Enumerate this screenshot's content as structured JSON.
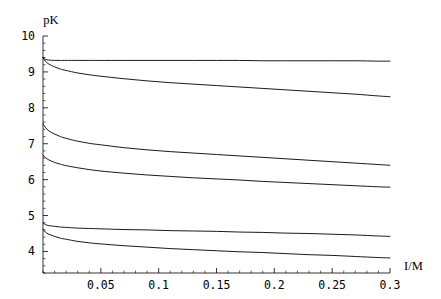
{
  "chart_data": {
    "type": "line",
    "title": "",
    "subtitle": "",
    "xlabel": "I/M",
    "ylabel": "pK",
    "xlim": [
      0.0,
      0.3
    ],
    "ylim": [
      3.4,
      10.0
    ],
    "grid": false,
    "legend": "none",
    "x_ticks": [
      0.05,
      0.1,
      0.15,
      0.2,
      0.25,
      0.3
    ],
    "x_tick_labels": [
      "0.05",
      "0.1",
      "0.15",
      "0.2",
      "0.25",
      "0.3"
    ],
    "y_ticks": [
      4,
      5,
      6,
      7,
      8,
      9,
      10
    ],
    "y_tick_labels": [
      "4",
      "5",
      "6",
      "7",
      "8",
      "9",
      "10"
    ],
    "x_minor_tick_step": 0.01,
    "y_minor_tick_step": 0.2,
    "x": [
      0.0,
      0.002,
      0.005,
      0.01,
      0.015,
      0.02,
      0.03,
      0.04,
      0.05,
      0.07,
      0.09,
      0.11,
      0.13,
      0.15,
      0.17,
      0.19,
      0.21,
      0.23,
      0.25,
      0.27,
      0.29,
      0.3
    ],
    "series": [
      {
        "name": "curve-1",
        "start_value": 9.4,
        "end_value": 9.3,
        "values": [
          9.4,
          9.35,
          9.33,
          9.32,
          9.32,
          9.32,
          9.32,
          9.32,
          9.32,
          9.32,
          9.32,
          9.32,
          9.32,
          9.32,
          9.32,
          9.31,
          9.31,
          9.31,
          9.31,
          9.31,
          9.3,
          9.3
        ]
      },
      {
        "name": "curve-2",
        "start_value": 9.4,
        "end_value": 8.3,
        "values": [
          9.4,
          9.3,
          9.22,
          9.14,
          9.08,
          9.04,
          8.97,
          8.92,
          8.88,
          8.81,
          8.75,
          8.7,
          8.66,
          8.62,
          8.58,
          8.54,
          8.5,
          8.46,
          8.42,
          8.38,
          8.33,
          8.31
        ]
      },
      {
        "name": "curve-3",
        "start_value": 7.55,
        "end_value": 6.4,
        "values": [
          7.55,
          7.46,
          7.36,
          7.27,
          7.2,
          7.15,
          7.07,
          7.01,
          6.97,
          6.89,
          6.83,
          6.78,
          6.74,
          6.7,
          6.66,
          6.62,
          6.58,
          6.54,
          6.5,
          6.46,
          6.42,
          6.4
        ]
      },
      {
        "name": "curve-4",
        "start_value": 6.68,
        "end_value": 5.8,
        "values": [
          6.68,
          6.62,
          6.55,
          6.48,
          6.43,
          6.39,
          6.33,
          6.28,
          6.24,
          6.18,
          6.13,
          6.09,
          6.05,
          6.02,
          5.99,
          5.95,
          5.92,
          5.89,
          5.86,
          5.83,
          5.8,
          5.79
        ]
      },
      {
        "name": "curve-5",
        "start_value": 4.8,
        "end_value": 4.42,
        "values": [
          4.8,
          4.75,
          4.72,
          4.7,
          4.68,
          4.67,
          4.65,
          4.64,
          4.63,
          4.61,
          4.6,
          4.58,
          4.57,
          4.56,
          4.54,
          4.53,
          4.51,
          4.5,
          4.48,
          4.46,
          4.43,
          4.42
        ]
      },
      {
        "name": "curve-6",
        "start_value": 4.62,
        "end_value": 3.82,
        "values": [
          4.62,
          4.54,
          4.48,
          4.42,
          4.37,
          4.34,
          4.28,
          4.24,
          4.21,
          4.16,
          4.12,
          4.08,
          4.05,
          4.02,
          3.99,
          3.97,
          3.94,
          3.91,
          3.89,
          3.86,
          3.83,
          3.82
        ]
      }
    ]
  },
  "axes": {
    "y_title": "pK",
    "x_title": "I/M"
  },
  "colors": {
    "background": "#ffffff",
    "axis": "#000000",
    "curve": "#000000",
    "text": "#000000"
  }
}
